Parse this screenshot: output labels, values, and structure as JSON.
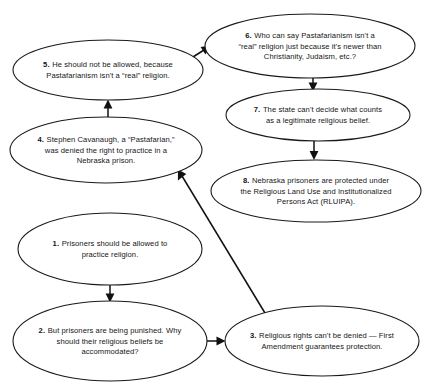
{
  "diagram": {
    "type": "argument-map",
    "background_color": "#ffffff",
    "node_stroke_color": "#1a1a1a",
    "node_fill_color": "#ffffff",
    "edge_color": "#111111",
    "nodes": [
      {
        "id": "node-1",
        "number": "1.",
        "lines": [
          "Prisoners should be allowed to",
          "practice religion."
        ],
        "cx": 110,
        "cy": 249,
        "rx": 92,
        "ry": 36
      },
      {
        "id": "node-2",
        "number": "2.",
        "lines": [
          "But prisoners are being punished. Why",
          "should their religious beliefs be",
          "accommodated?"
        ],
        "cx": 110,
        "cy": 341,
        "rx": 97,
        "ry": 40
      },
      {
        "id": "node-3",
        "number": "3.",
        "lines": [
          "Religious rights can't be denied — First",
          "Amendment guarantees protection."
        ],
        "cx": 322,
        "cy": 341,
        "rx": 97,
        "ry": 35
      },
      {
        "id": "node-4",
        "number": "4.",
        "lines": [
          "Stephen Cavanaugh, a “Pastafarian,”",
          "was denied the right to practice in a",
          "Nebraska prison."
        ],
        "cx": 106,
        "cy": 150,
        "rx": 96,
        "ry": 33
      },
      {
        "id": "node-5",
        "number": "5.",
        "lines": [
          "He should not be allowed, because",
          "Pastafarianism isn't a “real” religion."
        ],
        "cx": 108,
        "cy": 70,
        "rx": 95,
        "ry": 30
      },
      {
        "id": "node-6",
        "number": "6.",
        "lines": [
          "Who can say Pastafarianism isn't a",
          "“real” religion just because it's newer than",
          "Christianity, Judaism, etc.?"
        ],
        "cx": 310,
        "cy": 46,
        "rx": 105,
        "ry": 32
      },
      {
        "id": "node-7",
        "number": "7.",
        "lines": [
          "The state can't decide what counts",
          "as a legitimate religious belief."
        ],
        "cx": 318,
        "cy": 115,
        "rx": 92,
        "ry": 26
      },
      {
        "id": "node-8",
        "number": "8.",
        "lines": [
          "Nebraska prisoners are protected under",
          "the Religious Land Use and Institutionalized",
          "Persons Act (RLUIPA)."
        ],
        "cx": 316,
        "cy": 191,
        "rx": 105,
        "ry": 31
      }
    ],
    "edges": [
      {
        "id": "edge-1-to-2",
        "from": "node-1",
        "to": "node-2",
        "label": "1 supports 2",
        "direction": "down"
      },
      {
        "id": "edge-2-to-3",
        "from": "node-2",
        "to": "node-3",
        "label": "2 answered by 3",
        "direction": "right"
      },
      {
        "id": "edge-3-to-4",
        "from": "node-3",
        "to": "node-4",
        "label": "3 supports 4",
        "direction": "up-left"
      },
      {
        "id": "edge-4-to-5",
        "from": "node-4",
        "to": "node-5",
        "label": "4 objected by 5",
        "direction": "up"
      },
      {
        "id": "edge-5-to-6",
        "from": "node-5",
        "to": "node-6",
        "label": "5 answered by 6",
        "direction": "up-right"
      },
      {
        "id": "edge-6-to-7",
        "from": "node-6",
        "to": "node-7",
        "label": "6 supports 7",
        "direction": "down"
      },
      {
        "id": "edge-7-to-8",
        "from": "node-7",
        "to": "node-8",
        "label": "7 supports 8",
        "direction": "down"
      }
    ]
  }
}
